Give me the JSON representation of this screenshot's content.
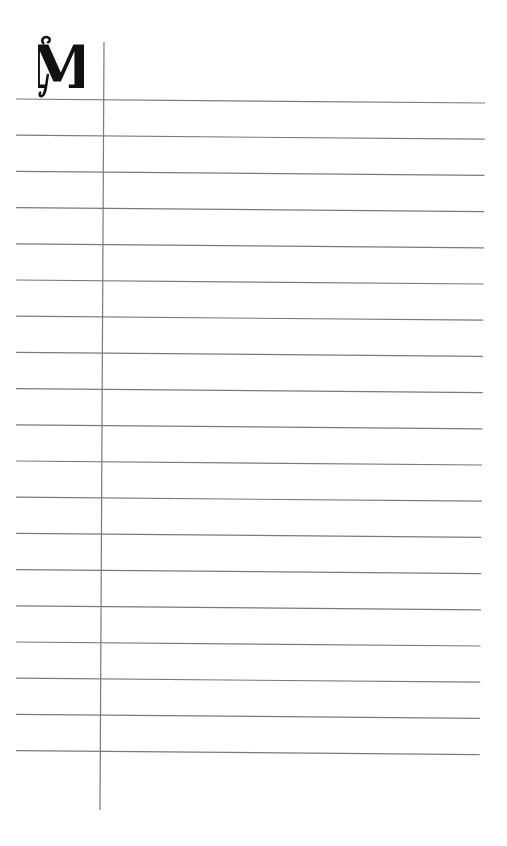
{
  "page": {
    "type": "lined-notepaper",
    "initial_letter": "M",
    "line_count": 19,
    "ink_color": "#111111",
    "rule_color": "#7a7a7a",
    "background": "#ffffff"
  }
}
